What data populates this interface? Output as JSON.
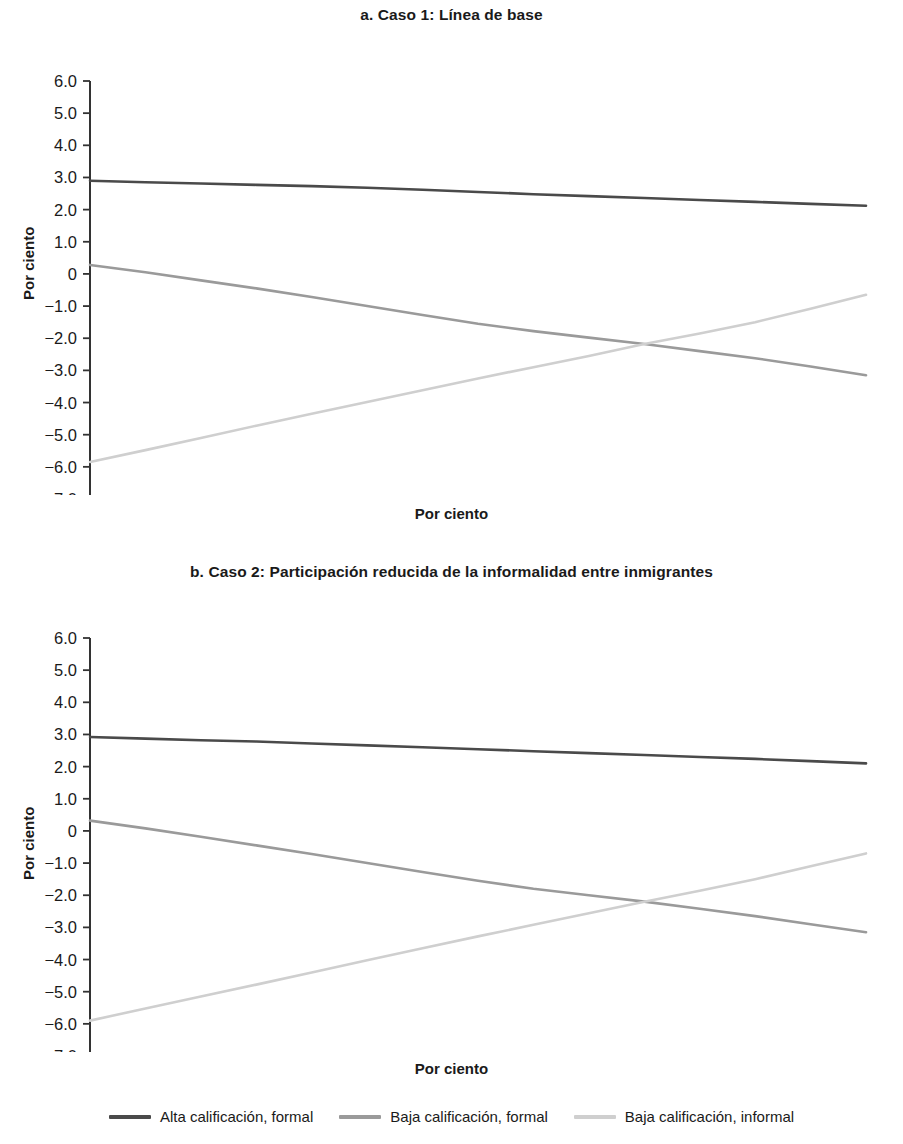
{
  "figure": {
    "x_axis_title": "Por ciento",
    "y_axis_title": "Por ciento"
  },
  "panels": {
    "a": {
      "title": "a. Caso 1:  Línea de base"
    },
    "b": {
      "title": "b. Caso 2:  Participación reducida de la informalidad entre inmigrantes"
    }
  },
  "legend": {
    "items": [
      {
        "label": "Alta calificación, formal",
        "color": "#4a4a4a"
      },
      {
        "label": "Baja calificación, formal",
        "color": "#9a9a9a"
      },
      {
        "label": "Baja calificación, informal",
        "color": "#cfcfcf"
      }
    ]
  },
  "chart_data": [
    {
      "id": "a",
      "type": "line",
      "title": "a. Caso 1:  Línea de base",
      "xlabel": "Por ciento",
      "ylabel": "Por ciento",
      "xlim": [
        85,
        15
      ],
      "ylim": [
        -7.0,
        6.0
      ],
      "x_reversed": true,
      "grid": false,
      "legend_position": "bottom",
      "x": [
        85,
        80,
        75,
        70,
        65,
        60,
        55,
        50,
        45,
        40,
        35,
        30,
        25,
        20,
        15
      ],
      "xticklabels": [
        "85",
        "80",
        "75",
        "70",
        "65",
        "60",
        "55",
        "50",
        "45",
        "40",
        "35",
        "30",
        "25",
        "20",
        "15"
      ],
      "yticks": [
        6.0,
        5.0,
        4.0,
        3.0,
        2.0,
        1.0,
        0,
        -1.0,
        -2.0,
        -3.0,
        -4.0,
        -5.0,
        -6.0,
        -7.0
      ],
      "yticklabels": [
        "6.0",
        "5.0",
        "4.0",
        "3.0",
        "2.0",
        "1.0",
        "0",
        "−1.0",
        "−2.0",
        "−3.0",
        "−4.0",
        "−5.0",
        "−6.0",
        "−7.0"
      ],
      "series": [
        {
          "name": "Alta calificación, formal",
          "color": "#4a4a4a",
          "values": [
            2.9,
            2.85,
            2.81,
            2.77,
            2.73,
            2.68,
            2.62,
            2.55,
            2.48,
            2.42,
            2.36,
            2.3,
            2.24,
            2.18,
            2.12
          ]
        },
        {
          "name": "Baja calificación, formal",
          "color": "#9a9a9a",
          "values": [
            0.28,
            0.05,
            -0.2,
            -0.45,
            -0.72,
            -1.0,
            -1.28,
            -1.55,
            -1.78,
            -1.98,
            -2.18,
            -2.4,
            -2.62,
            -2.88,
            -3.15
          ]
        },
        {
          "name": "Baja calificación, informal",
          "color": "#cfcfcf",
          "values": [
            -5.85,
            -5.48,
            -5.1,
            -4.72,
            -4.35,
            -3.98,
            -3.62,
            -3.25,
            -2.9,
            -2.55,
            -2.18,
            -1.85,
            -1.5,
            -1.08,
            -0.65
          ]
        }
      ]
    },
    {
      "id": "b",
      "type": "line",
      "title": "b. Caso 2:  Participación reducida de la informalidad entre inmigrantes",
      "xlabel": "Por ciento",
      "ylabel": "Por ciento",
      "xlim": [
        85,
        15
      ],
      "ylim": [
        -7.0,
        6.0
      ],
      "x_reversed": true,
      "grid": false,
      "legend_position": "bottom",
      "x": [
        85,
        80,
        75,
        70,
        65,
        60,
        55,
        50,
        45,
        40,
        35,
        30,
        25,
        20,
        15
      ],
      "xticklabels": [
        "85",
        "80",
        "75",
        "70",
        "65",
        "60",
        "55",
        "50",
        "45",
        "40",
        "35",
        "30",
        "25",
        "20",
        "15"
      ],
      "yticks": [
        6.0,
        5.0,
        4.0,
        3.0,
        2.0,
        1.0,
        0,
        -1.0,
        -2.0,
        -3.0,
        -4.0,
        -5.0,
        -6.0,
        -7.0
      ],
      "yticklabels": [
        "6.0",
        "5.0",
        "4.0",
        "3.0",
        "2.0",
        "1.0",
        "0",
        "−1.0",
        "−2.0",
        "−3.0",
        "−4.0",
        "−5.0",
        "−6.0",
        "−7.0"
      ],
      "series": [
        {
          "name": "Alta calificación, formal",
          "color": "#4a4a4a",
          "values": [
            2.92,
            2.87,
            2.82,
            2.78,
            2.72,
            2.66,
            2.6,
            2.54,
            2.48,
            2.42,
            2.36,
            2.3,
            2.24,
            2.17,
            2.1
          ]
        },
        {
          "name": "Baja calificación, formal",
          "color": "#9a9a9a",
          "values": [
            0.32,
            0.08,
            -0.18,
            -0.45,
            -0.72,
            -1.0,
            -1.28,
            -1.55,
            -1.8,
            -2.0,
            -2.2,
            -2.42,
            -2.65,
            -2.9,
            -3.15
          ]
        },
        {
          "name": "Baja calificación, informal",
          "color": "#cfcfcf",
          "values": [
            -5.9,
            -5.52,
            -5.15,
            -4.78,
            -4.4,
            -4.02,
            -3.65,
            -3.28,
            -2.92,
            -2.56,
            -2.2,
            -1.86,
            -1.5,
            -1.1,
            -0.7
          ]
        }
      ]
    }
  ]
}
